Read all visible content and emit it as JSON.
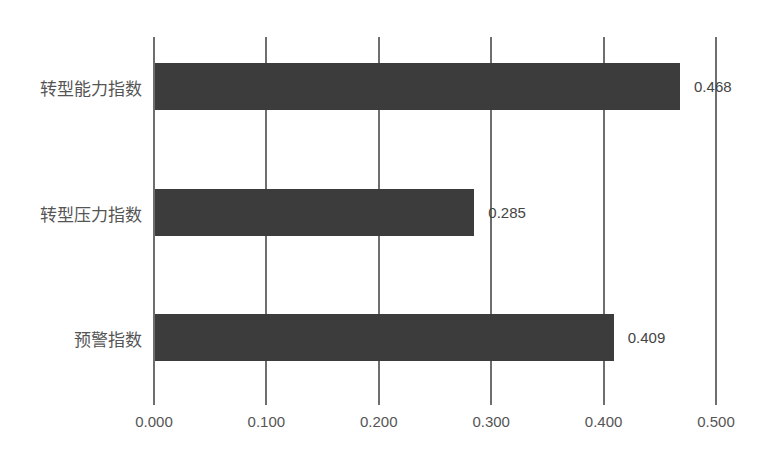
{
  "chart_data": {
    "type": "bar",
    "orientation": "horizontal",
    "title": "",
    "xlabel": "",
    "ylabel": "",
    "categories": [
      "转型能力指数",
      "转型压力指数",
      "预警指数"
    ],
    "values": [
      0.468,
      0.285,
      0.409
    ],
    "data_labels": [
      "0.468",
      "0.285",
      "0.409"
    ],
    "xlim": [
      0,
      0.5
    ],
    "x_ticks": [
      "0.000",
      "0.100",
      "0.200",
      "0.300",
      "0.400",
      "0.500"
    ],
    "grid": true,
    "legend": null,
    "bar_color": "#3c3c3c"
  }
}
